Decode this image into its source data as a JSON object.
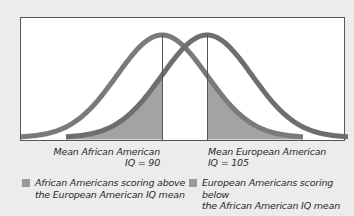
{
  "chart_data": {
    "type": "line",
    "title": "",
    "xlabel": "",
    "ylabel": "",
    "grid": false,
    "series": [
      {
        "name": "African American IQ distribution",
        "mean": 90,
        "sd": 15,
        "color": "#7a7a7a",
        "shaded_region": {
          "from": 105,
          "to": 137,
          "label": "African Americans scoring above the European American IQ mean"
        }
      },
      {
        "name": "European American IQ distribution",
        "mean": 105,
        "sd": 15,
        "color": "#6e6e6e",
        "shaded_region": {
          "from": 58,
          "to": 90,
          "label": "European Americans scoring below the African American IQ mean"
        }
      }
    ],
    "annotations": [
      {
        "x": 90,
        "text": "Mean African American IQ = 90"
      },
      {
        "x": 105,
        "text": "Mean European American IQ = 105"
      }
    ],
    "legend_position": "bottom",
    "xlim": [
      57,
      166
    ]
  },
  "labels": {
    "aa_mean_line1": "Mean African American",
    "aa_mean_line2": "IQ = 90",
    "ea_mean_line1": "Mean European American",
    "ea_mean_line2": "IQ = 105"
  },
  "legend": [
    {
      "line1": "African Americans scoring above",
      "line2": "the European American IQ mean",
      "color": "#9a9a9a"
    },
    {
      "line1": "European Americans scoring below",
      "line2": "the African American IQ mean",
      "color": "#9a9a9a"
    }
  ],
  "colors": {
    "background": "#ececec",
    "plot_bg": "#ffffff",
    "curve": "#737373",
    "shade": "#a3a3a3",
    "axis": "#555555"
  }
}
